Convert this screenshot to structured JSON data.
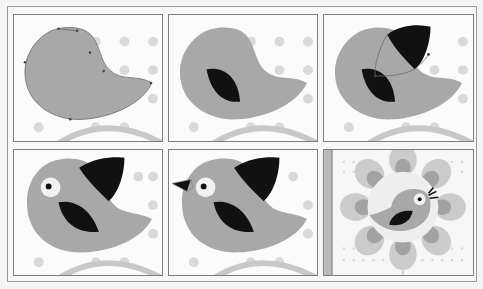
{
  "figure": {
    "colors": {
      "background": "#fbfbfb",
      "dots": "#d9d9d9",
      "arc": "#c8c8c8",
      "body": "#a8a8a8",
      "wing": "#111111",
      "eye_white": "#f2f2f2",
      "pupil": "#111111",
      "path_stroke": "#6a6a6a",
      "flower_petal_outer": "#c9c9c9",
      "flower_petal_inner": "#9e9e9e",
      "flower_center": "#eeeeee"
    },
    "panels": [
      {
        "step": 1,
        "label": "body-path-with-anchor-points"
      },
      {
        "step": 2,
        "label": "add-wing"
      },
      {
        "step": 3,
        "label": "add-top-wing-with-path"
      },
      {
        "step": 4,
        "label": "add-eye"
      },
      {
        "step": 5,
        "label": "add-beak"
      },
      {
        "step": 6,
        "label": "final-bird-on-flower"
      }
    ]
  }
}
